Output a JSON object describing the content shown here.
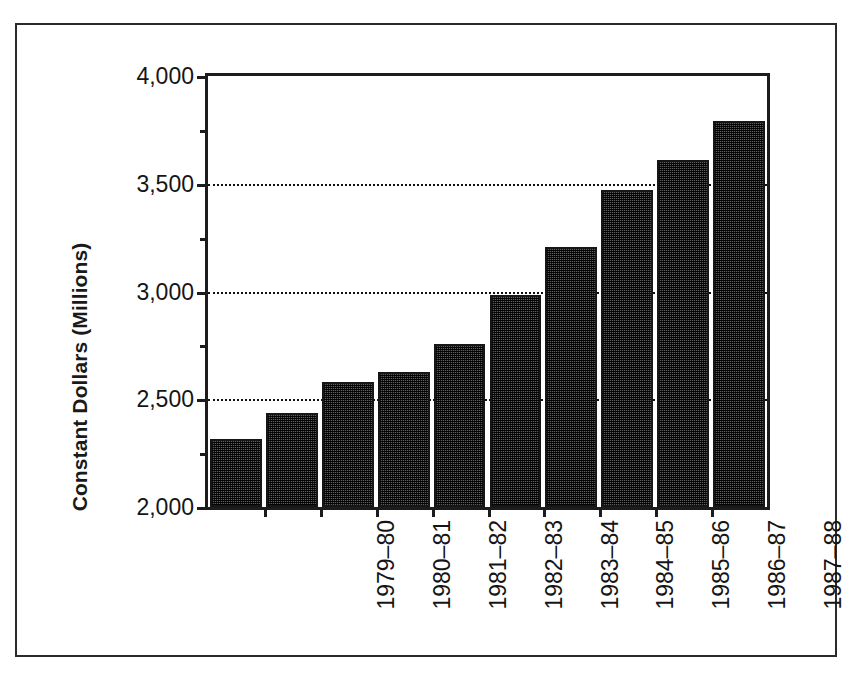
{
  "chart_data": {
    "type": "bar",
    "title": "",
    "subtitle": "",
    "xlabel": "",
    "ylabel": "Constant Dollars (Millions)",
    "categories": [
      "1979–80",
      "1980–81",
      "1981–82",
      "1982–83",
      "1983–84",
      "1984–85",
      "1985–86",
      "1986–87",
      "1987–88",
      "1988–89"
    ],
    "values": [
      2316,
      2435,
      2581,
      2627,
      2755,
      2984,
      3208,
      3473,
      3610,
      3790
    ],
    "ylim": [
      2000,
      4000
    ],
    "ytick_values": [
      2000,
      2500,
      3000,
      3500,
      4000
    ],
    "ytick_labels": [
      "2,000",
      "2,500",
      "3,000",
      "3,500",
      "4,000"
    ],
    "yminor_tick_values": [
      2250,
      2750,
      3250,
      3750
    ],
    "gridline_values": [
      2500,
      3000,
      3500
    ],
    "grid": "horizontal-dotted",
    "legend": "none",
    "bar_fill": "#5d5d5d",
    "bar_edge_color": "#161616",
    "axis_color": "#1c1c1c",
    "background": "#ffffff"
  },
  "figure": {
    "frame_color": "#2b2b2b"
  }
}
